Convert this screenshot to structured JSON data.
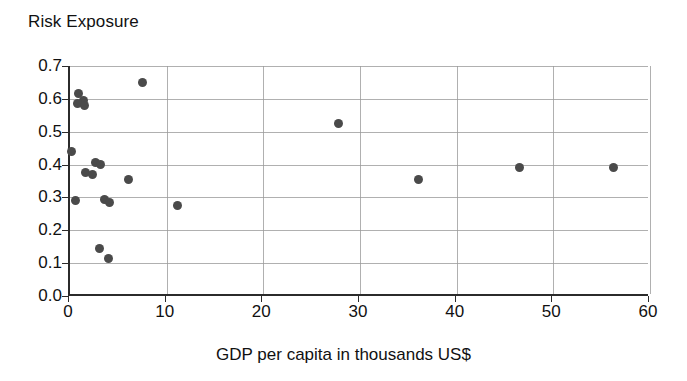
{
  "chart_data": {
    "type": "scatter",
    "title": "Risk Exposure",
    "xlabel": "GDP per capita in thousands US$",
    "ylabel": "Risk Exposure",
    "xlim": [
      0,
      60
    ],
    "ylim": [
      0.0,
      0.7
    ],
    "grid": true,
    "legend": null,
    "marker_color": "#4a4a4a",
    "axis_color": "#2b2b2b",
    "xticks": [
      "0",
      "10",
      "20",
      "30",
      "40",
      "50",
      "60"
    ],
    "xtick_values": [
      0,
      10,
      20,
      30,
      40,
      50,
      60
    ],
    "yticks": [
      "0.0",
      "0.1",
      "0.2",
      "0.3",
      "0.4",
      "0.5",
      "0.6",
      "0.7"
    ],
    "ytick_values": [
      0.0,
      0.1,
      0.2,
      0.3,
      0.4,
      0.5,
      0.6,
      0.7
    ],
    "points": [
      {
        "x": 0.9,
        "y": 0.615
      },
      {
        "x": 1.4,
        "y": 0.595
      },
      {
        "x": 0.8,
        "y": 0.585
      },
      {
        "x": 1.5,
        "y": 0.58
      },
      {
        "x": 7.5,
        "y": 0.65
      },
      {
        "x": 27.8,
        "y": 0.525
      },
      {
        "x": 0.2,
        "y": 0.44
      },
      {
        "x": 2.6,
        "y": 0.405
      },
      {
        "x": 3.2,
        "y": 0.4
      },
      {
        "x": 1.6,
        "y": 0.375
      },
      {
        "x": 2.3,
        "y": 0.37
      },
      {
        "x": 6.0,
        "y": 0.355
      },
      {
        "x": 36.0,
        "y": 0.355
      },
      {
        "x": 46.5,
        "y": 0.39
      },
      {
        "x": 56.2,
        "y": 0.39
      },
      {
        "x": 0.6,
        "y": 0.29
      },
      {
        "x": 3.6,
        "y": 0.295
      },
      {
        "x": 4.1,
        "y": 0.285
      },
      {
        "x": 11.1,
        "y": 0.275
      },
      {
        "x": 3.0,
        "y": 0.145
      },
      {
        "x": 4.0,
        "y": 0.115
      }
    ]
  }
}
